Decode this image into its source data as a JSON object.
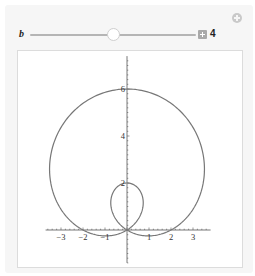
{
  "controls": {
    "add_icon": "circle-plus-icon",
    "parameter": {
      "label": "b",
      "value": "4",
      "min": 0,
      "max": 8,
      "current": 4,
      "increment_icon": "plus-box-icon"
    }
  },
  "chart_data": {
    "type": "line",
    "title": "",
    "xlabel": "",
    "ylabel": "",
    "equation": "r = 2 + 4 sin(theta)",
    "a": 2,
    "b": 4,
    "xlim": [
      -3.7,
      3.8
    ],
    "ylim": [
      -1.4,
      7.4
    ],
    "x_ticks": [
      -3,
      -2,
      -1,
      1,
      2,
      3
    ],
    "x_tick_labels": [
      "−3",
      "−2",
      "−1",
      "1",
      "2",
      "3"
    ],
    "y_ticks": [
      2,
      4,
      6
    ],
    "y_tick_labels": [
      "2",
      "4",
      "6"
    ],
    "grid": false,
    "legend": null,
    "key_points": [
      {
        "label": "top",
        "x": 0,
        "y": 6
      },
      {
        "label": "inner-loop-top",
        "x": 0,
        "y": 2
      },
      {
        "label": "x-intercept-right",
        "x": 2,
        "y": 0
      },
      {
        "label": "x-intercept-left",
        "x": -2,
        "y": 0
      },
      {
        "label": "origin",
        "x": 0,
        "y": 0
      },
      {
        "label": "max-x",
        "x": 3.7,
        "y": 2.7
      },
      {
        "label": "min-x",
        "x": -3.7,
        "y": 2.7
      }
    ],
    "curve_color": "#777777",
    "axis_color": "#555555"
  }
}
